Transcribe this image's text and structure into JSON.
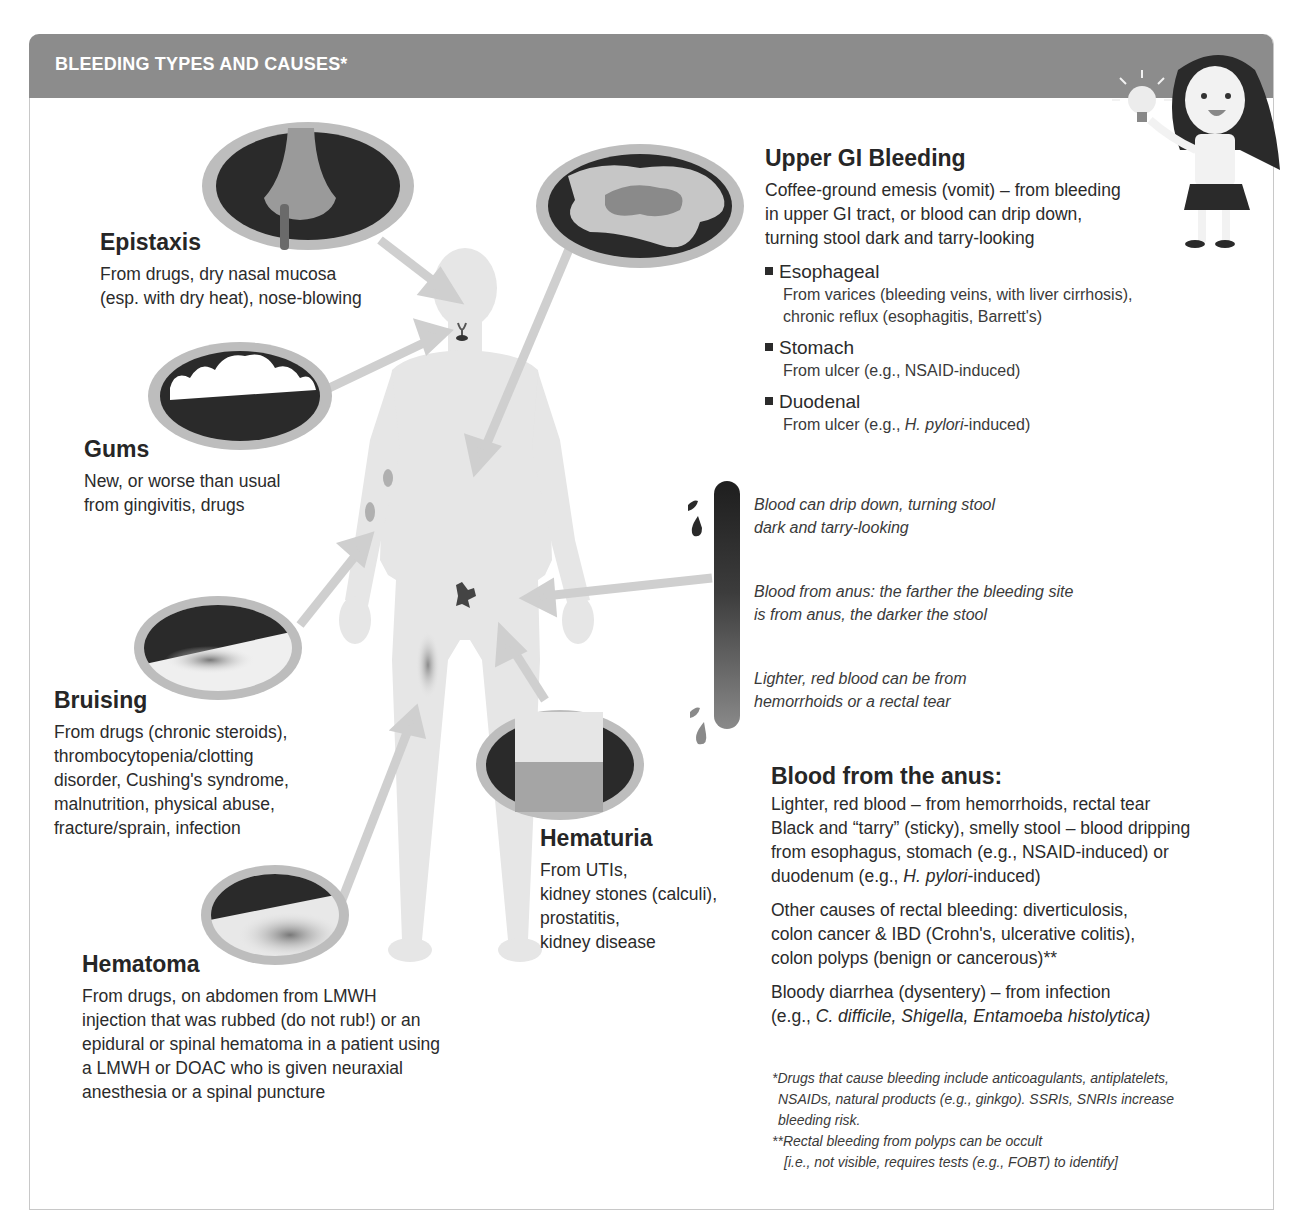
{
  "header": {
    "title": "BLEEDING TYPES AND CAUSES*",
    "mascot_icon": "girl-holding-lightbulb-icon"
  },
  "colors": {
    "header_bg": "#8c8c8c",
    "frame_border": "#c8c8c8",
    "body_silhouette": "#e6e6e6",
    "arrow": "#cfcfcf",
    "lens_dark": "#2a2a2a",
    "lens_ring": "#bdbdbd",
    "text": "#262626"
  },
  "sections": {
    "epistaxis": {
      "title": "Epistaxis",
      "lines": [
        "From drugs, dry nasal mucosa",
        "(esp. with dry heat), nose-blowing"
      ],
      "icon": "nose-bleed-icon"
    },
    "gums": {
      "title": "Gums",
      "lines": [
        "New, or worse than usual",
        "from gingivitis, drugs"
      ],
      "icon": "teeth-gums-icon"
    },
    "bruising": {
      "title": "Bruising",
      "lines": [
        "From drugs (chronic steroids),",
        "thrombocytopenia/clotting",
        "disorder, Cushing's syndrome,",
        "malnutrition, physical abuse,",
        "fracture/sprain, infection"
      ],
      "icon": "bruise-skin-icon"
    },
    "hematoma": {
      "title": "Hematoma",
      "lines": [
        "From drugs, on abdomen from LMWH",
        "injection that was rubbed (do not rub!) or an",
        "epidural or spinal hematoma in a patient using",
        "a LMWH or DOAC who is given neuraxial",
        "anesthesia or a spinal puncture"
      ],
      "icon": "hematoma-skin-icon"
    },
    "hematuria": {
      "title": "Hematuria",
      "lines": [
        "From UTIs,",
        "kidney stones (calculi),",
        "prostatitis,",
        "kidney disease"
      ],
      "icon": "urine-cup-icon"
    },
    "upper_gi": {
      "title": "Upper GI Bleeding",
      "lines": [
        "Coffee-ground emesis (vomit) – from bleeding",
        "in upper GI tract, or blood can drip down,",
        "turning stool dark and tarry-looking"
      ],
      "icon": "coffee-ground-emesis-icon",
      "items": [
        {
          "label": "Esophageal",
          "lines": [
            "From varices (bleeding veins, with liver cirrhosis),",
            "chronic reflux (esophagitis, Barrett's)"
          ]
        },
        {
          "label": "Stomach",
          "lines": [
            "From ulcer (e.g., NSAID-induced)"
          ]
        },
        {
          "label": "Duodenal",
          "pre": "From ulcer (e.g., ",
          "ital": "H. pylori",
          "post": "-induced)"
        }
      ]
    },
    "gradient_bar": {
      "notes": [
        {
          "lines": [
            "Blood can drip down, turning stool",
            "dark and tarry-looking"
          ]
        },
        {
          "lines": [
            "Blood from anus: the farther the bleeding site",
            "is from anus, the darker the stool"
          ]
        },
        {
          "lines": [
            "Lighter, red blood can be from",
            "hemorrhoids or a rectal tear"
          ]
        }
      ]
    },
    "anus": {
      "title": "Blood from the anus:",
      "p1": {
        "l1": "Lighter,  red blood – from hemorrhoids, rectal tear",
        "l2": "Black and “tarry” (sticky), smelly stool – blood dripping",
        "l3": "from esophagus, stomach (e.g., NSAID-induced) or",
        "l4_pre": "duodenum (e.g., ",
        "l4_ital": "H. pylori",
        "l4_post": "-induced)"
      },
      "p2": [
        "Other causes of rectal bleeding: diverticulosis,",
        "colon cancer & IBD (Crohn's, ulcerative colitis),",
        "colon polyps (benign or cancerous)**"
      ],
      "p3": {
        "l1": "Bloody diarrhea (dysentery) – from infection",
        "l2_pre": "(e.g., ",
        "l2_ital": "C. difficile, Shigella, Entamoeba histolytica)"
      }
    }
  },
  "footnotes": {
    "f1": [
      "*Drugs that cause bleeding include anticoagulants, antiplatelets,",
      "NSAIDs, natural products (e.g., ginkgo). SSRIs, SNRIs increase",
      "bleeding risk."
    ],
    "f2": [
      "**Rectal bleeding from polyps can be occult",
      "[i.e., not visible, requires tests (e.g., FOBT) to identify]"
    ]
  }
}
